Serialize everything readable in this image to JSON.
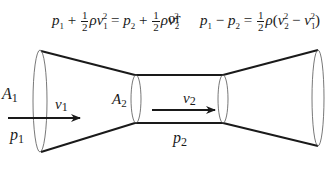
{
  "equation": {
    "left": {
      "p1": "p",
      "p1_sub": "1",
      "plus1": "+",
      "frac_num": "1",
      "frac_den": "2",
      "rho": "ρ",
      "v1": "v",
      "v1_sub": "1",
      "v1_sup": "2",
      "equals": "=",
      "p2": "p",
      "p2_sub": "2",
      "plus2": "+",
      "frac2_num": "1",
      "frac2_den": "2",
      "rho2": "ρ",
      "v2": "v",
      "v2_sub": "2",
      "v2_sup": "2"
    },
    "connector": "or",
    "right": {
      "p1": "p",
      "p1_sub": "1",
      "minus": "−",
      "p2": "p",
      "p2_sub": "2",
      "equals": "=",
      "frac_num": "1",
      "frac_den": "2",
      "rho": "ρ",
      "open": "(",
      "v2": "v",
      "v2_sub": "2",
      "v2_sup": "2",
      "minus2": "−",
      "v1": "v",
      "v1_sub": "1",
      "v1_sup": "2",
      "close": ")"
    }
  },
  "diagram": {
    "labels": {
      "A1": {
        "main": "A",
        "sub": "1"
      },
      "v1": {
        "main": "v",
        "sub": "1"
      },
      "p1": {
        "main": "p",
        "sub": "1"
      },
      "A2": {
        "main": "A",
        "sub": "2"
      },
      "v2": {
        "main": "v",
        "sub": "2"
      },
      "p2": {
        "main": "p",
        "sub": "2"
      }
    }
  }
}
